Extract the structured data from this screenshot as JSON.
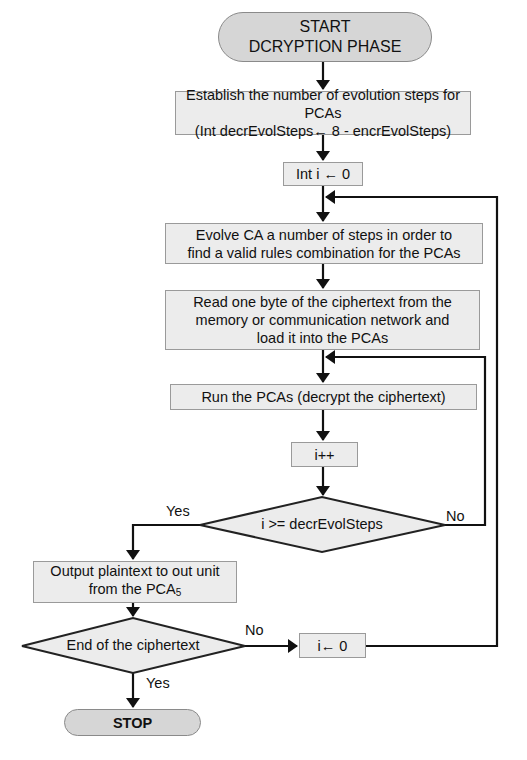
{
  "flowchart": {
    "start": {
      "line1": "START",
      "line2": "DCRYPTION PHASE"
    },
    "steps": {
      "establish": {
        "line1": "Establish the number of evolution steps for PCAs",
        "line2": "(Int decrEvolSteps← 8 - encrEvolSteps)"
      },
      "init_i": "Int i ←  0",
      "evolve": {
        "line1": "Evolve CA a number of steps in order to",
        "line2": "find a valid rules combination for the PCAs"
      },
      "read": {
        "line1": "Read one byte of the ciphertext from the",
        "line2": "memory or communication network and",
        "line3": "load it into the PCAs"
      },
      "run": "Run the PCAs (decrypt the ciphertext)",
      "increment": "i++",
      "output": {
        "line1": "Output plaintext to out unit",
        "line2_prefix": "from the PCA",
        "line2_sub": "5"
      },
      "reset_i": "i← 0"
    },
    "decisions": {
      "loop_check": {
        "text": "i >= decrEvolSteps",
        "yes_label": "Yes",
        "no_label": "No"
      },
      "end_check": {
        "text": "End of the ciphertext",
        "yes_label": "Yes",
        "no_label": "No"
      }
    },
    "stop": "STOP"
  },
  "colors": {
    "box_fill": "#ececec",
    "terminal_fill": "#d6d6d6",
    "box_border": "#9a9a9a",
    "line": "#111111"
  }
}
